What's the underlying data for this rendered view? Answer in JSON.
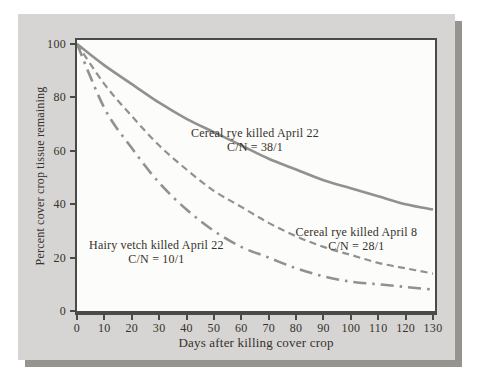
{
  "figure": {
    "kind": "textbook-line-chart",
    "x_axis_title": "Days after killing cover crop",
    "y_axis_title": "Percent cover crop tissue remaining"
  },
  "colors": {
    "panel_background": "#d6d5d3",
    "panel_shadow": "#95948f",
    "plot_background": "#fcfcfa",
    "frame": "#4a4a48",
    "curve": "#8f928e",
    "text": "#35312b"
  },
  "chart_data": {
    "type": "line",
    "title": "",
    "xlabel": "Days after killing cover crop",
    "ylabel": "Percent cover crop tissue remaining",
    "xlim": [
      0,
      130
    ],
    "ylim": [
      0,
      100
    ],
    "x_ticks": [
      0,
      10,
      20,
      30,
      40,
      50,
      60,
      70,
      80,
      90,
      100,
      110,
      120,
      130
    ],
    "y_ticks": [
      0,
      20,
      40,
      60,
      80,
      100
    ],
    "grid": false,
    "legend_position": "inline-annotations",
    "x": [
      0,
      10,
      20,
      30,
      40,
      50,
      60,
      70,
      80,
      90,
      100,
      110,
      120,
      130
    ],
    "series": [
      {
        "name": "Cereal rye killed April 22",
        "cn_label": "C/N = 38/1",
        "line_style": "solid",
        "values": [
          100,
          92,
          85,
          78,
          72,
          67,
          62,
          57,
          53,
          49,
          46,
          43,
          40,
          38
        ],
        "annotation": {
          "label_day": 65,
          "label_pct": 64
        }
      },
      {
        "name": "Cereal rye killed April 8",
        "cn_label": "C/N = 28/1",
        "line_style": "dashed",
        "values": [
          100,
          85,
          73,
          62,
          53,
          45,
          39,
          33,
          28,
          24,
          21,
          18,
          16,
          14
        ],
        "annotation": {
          "label_day": 102,
          "label_pct": 27
        }
      },
      {
        "name": "Hairy vetch killed April 22",
        "cn_label": "C/N = 10/1",
        "line_style": "dashdot",
        "values": [
          100,
          76,
          61,
          48,
          38,
          30,
          24,
          20,
          16,
          13,
          11,
          10,
          9,
          8
        ],
        "annotation": {
          "label_day": 29,
          "label_pct": 22
        }
      }
    ]
  }
}
